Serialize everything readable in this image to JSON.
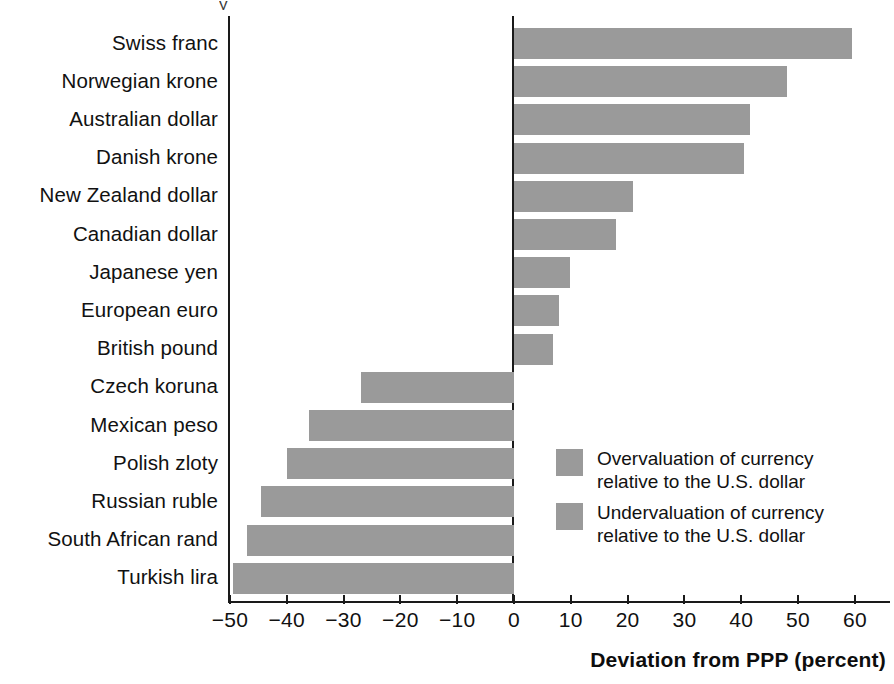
{
  "chart_data": {
    "type": "bar",
    "orientation": "horizontal",
    "title": "",
    "xlabel": "Deviation from PPP (percent)",
    "ylabel": "",
    "xlim": [
      -50,
      60
    ],
    "xticks": [
      -50,
      -40,
      -30,
      -20,
      -10,
      0,
      10,
      20,
      30,
      40,
      50,
      60
    ],
    "xticklabels": [
      "−50",
      "−40",
      "−30",
      "−20",
      "−10",
      "0",
      "10",
      "20",
      "30",
      "40",
      "50",
      "60"
    ],
    "grid": false,
    "bar_color": "#9a9a9a",
    "categories": [
      "Swiss franc",
      "Norwegian krone",
      "Australian dollar",
      "Danish krone",
      "New Zealand dollar",
      "Canadian dollar",
      "Japanese yen",
      "European euro",
      "British pound",
      "Czech koruna",
      "Mexican peso",
      "Polish zloty",
      "Russian ruble",
      "South African rand",
      "Turkish lira"
    ],
    "values": [
      59.5,
      48,
      41.5,
      40.5,
      21,
      18,
      9.8,
      8,
      6.8,
      -27,
      -36,
      -40,
      -44.5,
      -47,
      -49.5
    ],
    "legend": {
      "position": "inside-right",
      "entries": [
        "Overvaluation of currency\nrelative to the U.S. dollar",
        "Undervaluation of currency\nrelative to the U.S. dollar"
      ]
    }
  },
  "axis": {
    "title": "Deviation from PPP (percent)"
  },
  "title_remnant": "y"
}
